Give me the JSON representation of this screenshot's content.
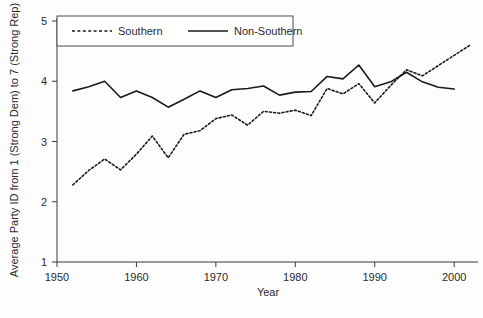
{
  "chart_data": {
    "type": "line",
    "title": "",
    "xlabel": "Year",
    "ylabel": "Average Party ID from 1 (Strong Dem) to 7 (Strong Rep)",
    "xlim": [
      1950,
      2003
    ],
    "ylim": [
      1,
      5
    ],
    "xticks": [
      1950,
      1960,
      1970,
      1980,
      1990,
      2000
    ],
    "yticks": [
      1,
      2,
      3,
      4,
      5
    ],
    "grid": false,
    "legend_position": "top-left",
    "series": [
      {
        "name": "Southern",
        "style": "dashed",
        "color": "#1a1a1a",
        "x": [
          1952,
          1954,
          1956,
          1958,
          1960,
          1962,
          1964,
          1966,
          1968,
          1970,
          1972,
          1974,
          1976,
          1978,
          1980,
          1982,
          1984,
          1986,
          1988,
          1990,
          1992,
          1994,
          1996,
          1998,
          2000,
          2002
        ],
        "values": [
          2.28,
          2.52,
          2.71,
          2.53,
          2.79,
          3.09,
          2.73,
          3.12,
          3.18,
          3.38,
          3.44,
          3.27,
          3.5,
          3.47,
          3.52,
          3.43,
          3.88,
          3.79,
          3.96,
          3.64,
          3.93,
          4.19,
          4.09,
          4.26,
          4.43,
          4.6
        ]
      },
      {
        "name": "Non-Southern",
        "style": "solid",
        "color": "#1a1a1a",
        "x": [
          1952,
          1954,
          1956,
          1958,
          1960,
          1962,
          1964,
          1966,
          1968,
          1970,
          1972,
          1974,
          1976,
          1978,
          1980,
          1982,
          1984,
          1986,
          1988,
          1990,
          1992,
          1994,
          1996,
          1998,
          2000
        ],
        "values": [
          3.84,
          3.91,
          4.0,
          3.73,
          3.84,
          3.73,
          3.57,
          3.7,
          3.84,
          3.73,
          3.86,
          3.88,
          3.92,
          3.77,
          3.82,
          3.83,
          4.08,
          4.04,
          4.27,
          3.91,
          3.99,
          4.15,
          3.99,
          3.9,
          3.87
        ]
      }
    ]
  },
  "legend": {
    "items": [
      {
        "label": "Southern",
        "style": "dashed"
      },
      {
        "label": "Non-Southern",
        "style": "solid"
      }
    ]
  },
  "axes": {
    "x_title": "Year",
    "y_title": "Average Party ID from 1 (Strong Dem) to 7 (Strong Rep)",
    "x_tick_labels": [
      "1950",
      "1960",
      "1970",
      "1980",
      "1990",
      "2000"
    ],
    "y_tick_labels": [
      "1",
      "2",
      "3",
      "4",
      "5"
    ]
  },
  "colors": {
    "line": "#1a1a1a",
    "axis": "#3a3a3a",
    "text": "#2b2b2b",
    "background": "#fdfdfd"
  }
}
